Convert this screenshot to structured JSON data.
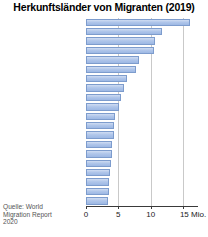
{
  "chart": {
    "title": "Herkunftsländer von Migranten (2019)",
    "source": "Quelle: World Migration Report 2020",
    "axis_unit": "Mio.",
    "bar_color": "#aec5e8",
    "bar_border_color": "#7d9ccd",
    "grid_color": "#c9c9c9"
  },
  "chart_data": {
    "type": "bar",
    "orientation": "horizontal",
    "title": "Herkunftsländer von Migranten (2019)",
    "xlabel": "Mio.",
    "ylabel": "",
    "xlim": [
      0,
      15
    ],
    "xticks": [
      0,
      5,
      10,
      15
    ],
    "xtick_labels": [
      "0",
      "5",
      "10",
      "15 Mio."
    ],
    "grid": true,
    "legend": null,
    "annotations": [
      "Quelle: World Migration Report 2020"
    ],
    "categories": [
      "Indien",
      "Mexiko",
      "China",
      "Russland",
      "Syrien",
      "Bangladesch",
      "Pakistan",
      "Ukraine",
      "Philippinen",
      "Afghanistan",
      "Indonesien",
      "Polen",
      "Großbritannien",
      "Deutschland",
      "Kasachstan",
      "Palästina",
      "Myanmar",
      "Rumänien",
      "Ägypten",
      "Türkei"
    ],
    "values": [
      17.5,
      11.8,
      10.7,
      10.5,
      8.2,
      7.8,
      6.3,
      5.9,
      5.4,
      5.1,
      4.5,
      4.4,
      4.3,
      4.0,
      4.0,
      3.8,
      3.7,
      3.6,
      3.5,
      3.4
    ]
  }
}
